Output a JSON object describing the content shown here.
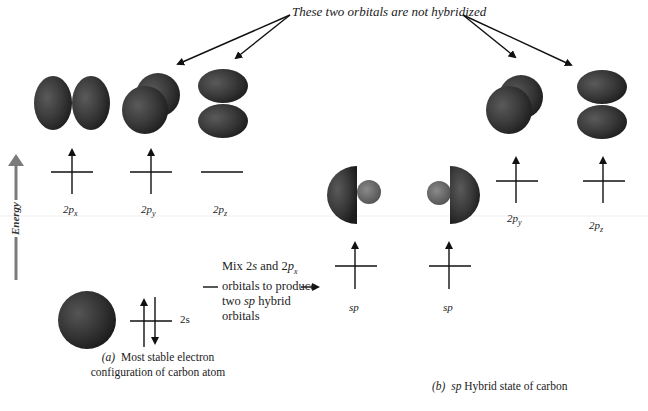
{
  "callout": {
    "text": "These two orbitals are not hybridized"
  },
  "energy_axis": {
    "label": "Energy",
    "color": "#7a7a7a"
  },
  "panel_a": {
    "p_orbitals": [
      {
        "label_main": "2p",
        "label_sub": "x",
        "electrons": "up"
      },
      {
        "label_main": "2p",
        "label_sub": "y",
        "electrons": "up"
      },
      {
        "label_main": "2p",
        "label_sub": "z",
        "electrons": "none"
      }
    ],
    "s_orbital": {
      "label": "2s",
      "electrons": "up-down"
    },
    "caption_prefix": "(a)",
    "caption_line1": "Most stable electron",
    "caption_line2": "configuration of carbon atom"
  },
  "transition": {
    "line1_a": "Mix 2",
    "line1_s": "s",
    "line1_b": " and 2",
    "line1_p": "p",
    "line1_sub": "x",
    "line2": "orbitals to produce",
    "line3_a": "two ",
    "line3_sp": "sp",
    "line3_b": " hybrid",
    "line4": "orbitals"
  },
  "panel_b": {
    "sp_orbitals": [
      {
        "label": "sp",
        "electrons": "up"
      },
      {
        "label": "sp",
        "electrons": "up"
      }
    ],
    "p_orbitals": [
      {
        "label_main": "2p",
        "label_sub": "y",
        "electrons": "up"
      },
      {
        "label_main": "2p",
        "label_sub": "z",
        "electrons": "up"
      }
    ],
    "caption_prefix": "(b)",
    "caption_sp": "sp",
    "caption_rest": " Hybrid state of carbon"
  },
  "colors": {
    "orbital_dark": "#2b2b2b",
    "orbital_mid": "#4a4a4a",
    "orbital_small": "#6a6a6a",
    "line": "#111111"
  }
}
